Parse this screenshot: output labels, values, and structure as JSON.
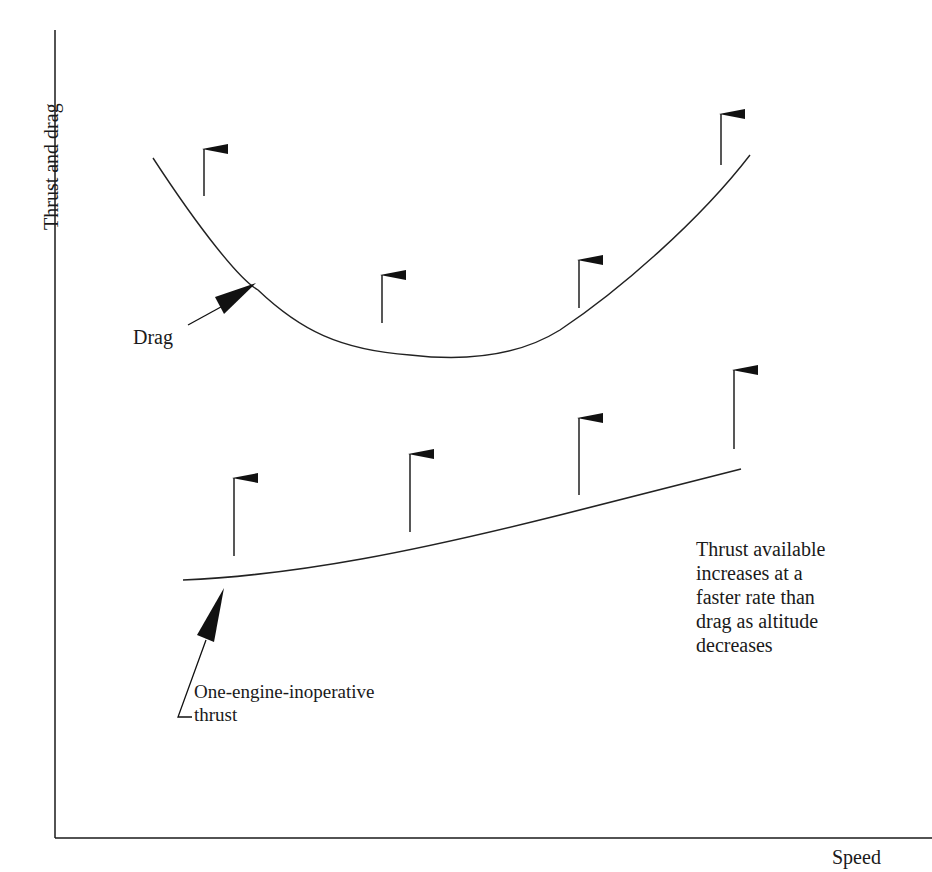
{
  "diagram": {
    "title": "",
    "axes": {
      "y_label": "Thrust and drag",
      "x_label": "Speed",
      "color": "#1a1a1a"
    },
    "curves": [
      {
        "name": "Drag",
        "label": "Drag",
        "shape": "U-shaped (parabolic)",
        "path": "M153,158 C200,230 240,280 258,290 C300,330 340,350 410,355 C470,362 520,355 560,330 C620,290 700,220 750,155"
      },
      {
        "name": "One-engine-inoperative thrust",
        "label": "One-engine-inoperative\nthrust",
        "shape": "gently rising",
        "path": "M183,580 C300,575 420,550 560,515 C640,495 700,480 741,469"
      }
    ],
    "arrows": {
      "drag_curve_arrows": [
        {
          "x": 204,
          "y_tail": 196,
          "y_head": 147
        },
        {
          "x": 382,
          "y_tail": 323,
          "y_head": 273
        },
        {
          "x": 579,
          "y_tail": 308,
          "y_head": 258
        },
        {
          "x": 721,
          "y_tail": 165,
          "y_head": 112
        }
      ],
      "thrust_curve_arrows": [
        {
          "x": 234,
          "y_tail": 556,
          "y_head": 476
        },
        {
          "x": 410,
          "y_tail": 532,
          "y_head": 452
        },
        {
          "x": 579,
          "y_tail": 495,
          "y_head": 416
        },
        {
          "x": 734,
          "y_tail": 449,
          "y_head": 368
        }
      ],
      "meaning": "Curves shift upward as altitude decreases"
    },
    "annotations": {
      "drag": "Drag",
      "thrust": "One-engine-inoperative\nthrust",
      "note": "Thrust available\nincreases at a\nfaster rate than\ndrag as altitude\ndecreases"
    }
  }
}
